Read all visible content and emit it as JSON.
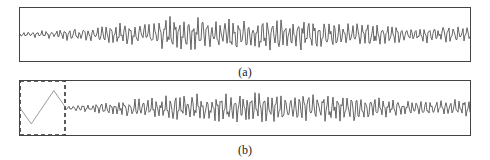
{
  "figure": {
    "panels": [
      {
        "id": "a",
        "caption": "(a)"
      },
      {
        "id": "b",
        "caption": "(b)"
      }
    ]
  },
  "colors": {
    "frame": "#444444",
    "signal": "#555555",
    "trigger": "#9a9a9a",
    "dashed_box": "#333333"
  },
  "chart_data": [
    {
      "type": "line",
      "title": "(a)",
      "xlabel": "",
      "ylabel": "",
      "grid": false,
      "legend": null,
      "description": "Noise-like oscillating time-series signal spanning the full panel width; low amplitude at the left edge, larger amplitude in the middle, slightly smaller toward the right end.",
      "x_range": [
        0,
        1
      ],
      "y_range": [
        -1,
        1
      ],
      "amplitude_envelope": [
        {
          "x": 0.0,
          "amp": 0.08
        },
        {
          "x": 0.06,
          "amp": 0.2
        },
        {
          "x": 0.2,
          "amp": 0.45
        },
        {
          "x": 0.35,
          "amp": 0.8
        },
        {
          "x": 0.55,
          "amp": 0.75
        },
        {
          "x": 0.75,
          "amp": 0.6
        },
        {
          "x": 0.85,
          "amp": 0.35
        },
        {
          "x": 1.0,
          "amp": 0.4
        }
      ],
      "seed": 7
    },
    {
      "type": "line",
      "title": "(b)",
      "xlabel": "",
      "ylabel": "",
      "grid": false,
      "legend": null,
      "description": "Same signal as (a) preceded by a dashed-box region containing a triangular trigger waveform; the signal continues to the right of the dashed boundary.",
      "trigger_region": {
        "x_start": 0.0,
        "x_end": 0.1,
        "style": "dashed-box"
      },
      "trigger_waveform": {
        "type": "triangle",
        "points": [
          {
            "x": 0.0,
            "y": 0.0
          },
          {
            "x": 0.025,
            "y": -0.62
          },
          {
            "x": 0.075,
            "y": 0.68
          },
          {
            "x": 0.1,
            "y": 0.05
          }
        ]
      },
      "x_range": [
        0,
        1
      ],
      "y_range": [
        -1,
        1
      ],
      "amplitude_envelope": [
        {
          "x": 0.1,
          "amp": 0.08
        },
        {
          "x": 0.2,
          "amp": 0.3
        },
        {
          "x": 0.35,
          "amp": 0.6
        },
        {
          "x": 0.55,
          "amp": 0.7
        },
        {
          "x": 0.75,
          "amp": 0.6
        },
        {
          "x": 0.86,
          "amp": 0.3
        },
        {
          "x": 1.0,
          "amp": 0.4
        }
      ],
      "seed": 11
    }
  ]
}
